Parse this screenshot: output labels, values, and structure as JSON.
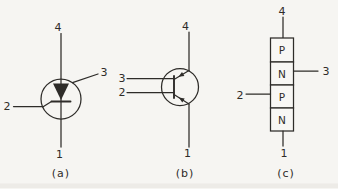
{
  "colors": {
    "background": "#f6f5f2",
    "ink": "#2e2c29",
    "box_fill": "#f8f7f4"
  },
  "panels": {
    "a": {
      "caption": "(a)",
      "type": "circuit-symbol-scr-style",
      "terminals": {
        "top": "4",
        "right": "3",
        "left": "2",
        "bottom": "1"
      }
    },
    "b": {
      "caption": "(b)",
      "type": "transistor-style-symbol",
      "terminals": {
        "top": "4",
        "upper_left": "3",
        "lower_left": "2",
        "bottom": "1"
      }
    },
    "c": {
      "caption": "(c)",
      "type": "pnpn-layer-structure",
      "layers": [
        "P",
        "N",
        "P",
        "N"
      ],
      "terminals": {
        "top": "4",
        "right": "3",
        "left": "2",
        "bottom": "1"
      }
    }
  }
}
